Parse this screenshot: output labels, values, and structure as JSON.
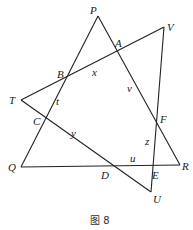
{
  "figure": {
    "caption": "图 8",
    "points": {
      "P": {
        "label": "P",
        "x": 98,
        "y": 16
      },
      "V": {
        "label": "V",
        "x": 164,
        "y": 27
      },
      "T": {
        "label": "T",
        "x": 21,
        "y": 100
      },
      "Q": {
        "label": "Q",
        "x": 21,
        "y": 167
      },
      "R": {
        "label": "R",
        "x": 180,
        "y": 165
      },
      "U": {
        "label": "U",
        "x": 151,
        "y": 192
      },
      "A": {
        "label": "A",
        "x": 117,
        "y": 51
      },
      "B": {
        "label": "B",
        "x": 68,
        "y": 77
      },
      "C": {
        "label": "C",
        "x": 45,
        "y": 120
      },
      "D": {
        "label": "D",
        "x": 110,
        "y": 165
      },
      "E": {
        "label": "E",
        "x": 153,
        "y": 166
      },
      "F": {
        "label": "F",
        "x": 156,
        "y": 120
      }
    },
    "segment_labels": {
      "x": "x",
      "v": "v",
      "t": "t",
      "y": "y",
      "z": "z",
      "u": "u"
    },
    "lines": [
      [
        "P",
        "Q"
      ],
      [
        "P",
        "R"
      ],
      [
        "Q",
        "R"
      ],
      [
        "T",
        "V"
      ],
      [
        "T",
        "U"
      ],
      [
        "V",
        "U"
      ]
    ]
  }
}
